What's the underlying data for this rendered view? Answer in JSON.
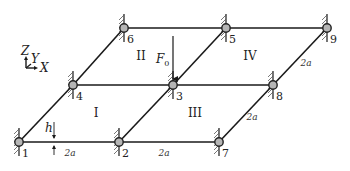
{
  "figure": {
    "colors": {
      "beam": "#1a1a1a",
      "node_fill": "#b5b5b5",
      "node_stroke": "#222222",
      "hatch": "#555555",
      "text": "#222222"
    }
  },
  "axes": {
    "z_label": "Z",
    "y_label": "Y",
    "x_label": "X"
  },
  "nodes": [
    {
      "id": "1",
      "label": "1",
      "x": 19,
      "y": 142
    },
    {
      "id": "2",
      "label": "2",
      "x": 119,
      "y": 142
    },
    {
      "id": "3",
      "label": "3",
      "x": 173,
      "y": 85
    },
    {
      "id": "4",
      "label": "4",
      "x": 73,
      "y": 85
    },
    {
      "id": "5",
      "label": "5",
      "x": 226,
      "y": 28
    },
    {
      "id": "6",
      "label": "6",
      "x": 124,
      "y": 28
    },
    {
      "id": "7",
      "label": "7",
      "x": 219,
      "y": 142
    },
    {
      "id": "8",
      "label": "8",
      "x": 273,
      "y": 85
    },
    {
      "id": "9",
      "label": "9",
      "x": 327,
      "y": 28
    }
  ],
  "members": [
    [
      "1",
      "2"
    ],
    [
      "2",
      "7"
    ],
    [
      "4",
      "3"
    ],
    [
      "3",
      "8"
    ],
    [
      "6",
      "5"
    ],
    [
      "5",
      "9"
    ],
    [
      "1",
      "4"
    ],
    [
      "4",
      "6"
    ],
    [
      "2",
      "3"
    ],
    [
      "3",
      "5"
    ],
    [
      "7",
      "8"
    ],
    [
      "8",
      "9"
    ]
  ],
  "regions": [
    {
      "label": "I",
      "x": 96,
      "y": 117
    },
    {
      "label": "II",
      "x": 141,
      "y": 60
    },
    {
      "label": "III",
      "x": 195,
      "y": 117
    },
    {
      "label": "IV",
      "x": 250,
      "y": 60
    }
  ],
  "load": {
    "label": "F",
    "subscript": "0",
    "node": "3",
    "from_y": 36
  },
  "dimensions": [
    {
      "label": "2a",
      "x": 70,
      "y": 156
    },
    {
      "label": "2a",
      "x": 164,
      "y": 156
    },
    {
      "label": "2a",
      "x": 252,
      "y": 120
    },
    {
      "label": "2a",
      "x": 306,
      "y": 66
    }
  ],
  "thickness": {
    "label": "h",
    "x": 54,
    "y": 136
  }
}
